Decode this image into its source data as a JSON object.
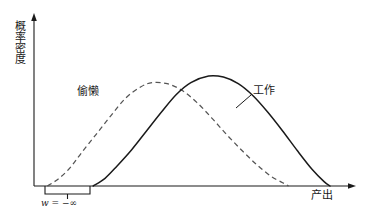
{
  "figure": {
    "background_color": "#ffffff",
    "line_color": "#1a1a1a"
  },
  "axes": {
    "y_label": "概率密度",
    "x_label": "产出",
    "x_axis_arrow": "arrow-right",
    "y_axis_arrow": "arrow-up",
    "origin_px": [
      34,
      186
    ],
    "x_axis_end_px": [
      355,
      186
    ],
    "y_axis_top_px": [
      34,
      15
    ]
  },
  "annotations": {
    "shirk_label": "偷懒",
    "work_label": "工作",
    "wage_text": "w = −∞",
    "wage_symbol": "w",
    "wage_operator": "=",
    "wage_value": "−∞",
    "bracket_span_px": [
      45,
      90
    ]
  },
  "chart_data": {
    "type": "line",
    "title": "",
    "xlabel": "产出",
    "ylabel": "概率密度",
    "xlim": [
      0,
      1
    ],
    "ylim": [
      0,
      1
    ],
    "grid": false,
    "legend": "inline-annotations",
    "series": [
      {
        "name": "偷懒",
        "style": "dashed",
        "color": "#555555",
        "peak_x": 0.4,
        "peak_y": 0.94,
        "support_start_x": 0.045,
        "support_end_x": 0.86,
        "points": [
          [
            0.045,
            0.0
          ],
          [
            0.08,
            0.06
          ],
          [
            0.12,
            0.16
          ],
          [
            0.16,
            0.3
          ],
          [
            0.21,
            0.47
          ],
          [
            0.26,
            0.64
          ],
          [
            0.31,
            0.8
          ],
          [
            0.36,
            0.9
          ],
          [
            0.4,
            0.94
          ],
          [
            0.45,
            0.93
          ],
          [
            0.5,
            0.87
          ],
          [
            0.55,
            0.76
          ],
          [
            0.6,
            0.62
          ],
          [
            0.65,
            0.47
          ],
          [
            0.7,
            0.33
          ],
          [
            0.75,
            0.2
          ],
          [
            0.8,
            0.09
          ],
          [
            0.84,
            0.03
          ],
          [
            0.86,
            0.0
          ]
        ]
      },
      {
        "name": "工作",
        "style": "solid",
        "color": "#1a1a1a",
        "peak_x": 0.59,
        "peak_y": 1.0,
        "support_start_x": 0.2,
        "support_end_x": 1.0,
        "points": [
          [
            0.2,
            0.0
          ],
          [
            0.24,
            0.07
          ],
          [
            0.28,
            0.18
          ],
          [
            0.33,
            0.33
          ],
          [
            0.38,
            0.5
          ],
          [
            0.43,
            0.67
          ],
          [
            0.48,
            0.83
          ],
          [
            0.53,
            0.94
          ],
          [
            0.59,
            1.0
          ],
          [
            0.64,
            0.99
          ],
          [
            0.69,
            0.93
          ],
          [
            0.74,
            0.82
          ],
          [
            0.79,
            0.67
          ],
          [
            0.84,
            0.5
          ],
          [
            0.89,
            0.32
          ],
          [
            0.94,
            0.15
          ],
          [
            0.98,
            0.04
          ],
          [
            1.0,
            0.0
          ]
        ]
      }
    ]
  }
}
